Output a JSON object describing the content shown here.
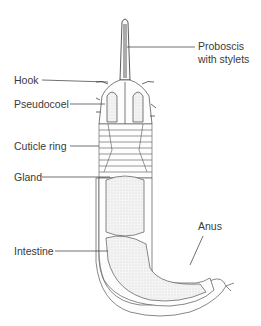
{
  "labels": {
    "proboscis_line1": "Proboscis",
    "proboscis_line2": "with stylets",
    "hook": "Hook",
    "pseudocoel": "Pseudocoel",
    "cuticle_ring": "Cuticle ring",
    "gland": "Gland",
    "intestine": "Intestine",
    "anus": "Anus"
  }
}
